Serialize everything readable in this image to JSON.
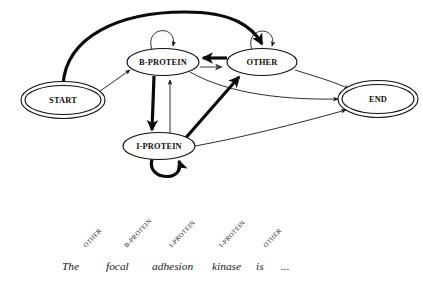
{
  "figure": {
    "background_color": "#ffffff",
    "line_color": "#111111",
    "gray_edge_color": "#7b7b7b"
  },
  "nodes": [
    {
      "id": "start",
      "label": "START",
      "cx": 63,
      "cy": 100,
      "rx": 38,
      "ry": 14.5,
      "double": true
    },
    {
      "id": "bprotein",
      "label": "B-PROTEIN",
      "cx": 163,
      "cy": 62,
      "rx": 36,
      "ry": 13.5,
      "double": false
    },
    {
      "id": "other",
      "label": "OTHER",
      "cx": 262,
      "cy": 62,
      "rx": 35,
      "ry": 13.5,
      "double": false
    },
    {
      "id": "iprotein",
      "label": "I-PROTEIN",
      "cx": 159,
      "cy": 146,
      "rx": 36,
      "ry": 13.5,
      "double": false
    },
    {
      "id": "end",
      "label": "END",
      "cx": 378,
      "cy": 99,
      "rx": 36,
      "ry": 14.5,
      "double": true
    }
  ],
  "edges": [
    {
      "id": "start-to-other",
      "from": "START",
      "to": "OTHER",
      "weight": "thick",
      "color": "#0b0b0b"
    },
    {
      "id": "start-to-bprotein",
      "from": "START",
      "to": "B-PROTEIN",
      "weight": "thin",
      "color": "#161616"
    },
    {
      "id": "bprotein-self",
      "from": "B-PROTEIN",
      "to": "B-PROTEIN",
      "weight": "thin",
      "color": "#161616"
    },
    {
      "id": "other-self",
      "from": "OTHER",
      "to": "OTHER",
      "weight": "thin",
      "color": "#161616"
    },
    {
      "id": "iprotein-self",
      "from": "I-PROTEIN",
      "to": "I-PROTEIN",
      "weight": "thick",
      "color": "#0b0b0b"
    },
    {
      "id": "other-to-bprotein",
      "from": "OTHER",
      "to": "B-PROTEIN",
      "weight": "thick",
      "color": "#0b0b0b"
    },
    {
      "id": "bprotein-to-other",
      "from": "B-PROTEIN",
      "to": "OTHER",
      "weight": "gray",
      "color": "#7b7b7b"
    },
    {
      "id": "bprotein-to-iprotein",
      "from": "B-PROTEIN",
      "to": "I-PROTEIN",
      "weight": "thick",
      "color": "#0b0b0b"
    },
    {
      "id": "iprotein-to-bprotein",
      "from": "I-PROTEIN",
      "to": "B-PROTEIN",
      "weight": "thin",
      "color": "#161616"
    },
    {
      "id": "iprotein-to-other",
      "from": "I-PROTEIN",
      "to": "OTHER",
      "weight": "thick",
      "color": "#0b0b0b"
    },
    {
      "id": "other-to-end",
      "from": "OTHER",
      "to": "END",
      "weight": "thin",
      "color": "#161616"
    },
    {
      "id": "bprotein-to-end",
      "from": "B-PROTEIN",
      "to": "END",
      "weight": "thin",
      "color": "#161616"
    },
    {
      "id": "iprotein-to-end",
      "from": "I-PROTEIN",
      "to": "END",
      "weight": "thin",
      "color": "#161616"
    }
  ],
  "sequence_labels": [
    {
      "text": "OTHER",
      "x": 86,
      "y": 248
    },
    {
      "text": "B-PROTEIN",
      "x": 127,
      "y": 248
    },
    {
      "text": "I-PROTEIN",
      "x": 172,
      "y": 248
    },
    {
      "text": "I-PROTEIN",
      "x": 222,
      "y": 248
    },
    {
      "text": "OTHER",
      "x": 266,
      "y": 248
    }
  ],
  "sentence": {
    "words": [
      "The",
      "focal",
      "adhesion",
      "kinase",
      "is",
      "..."
    ],
    "x_positions": [
      62,
      106,
      152,
      212,
      256,
      281
    ],
    "y": 270
  }
}
